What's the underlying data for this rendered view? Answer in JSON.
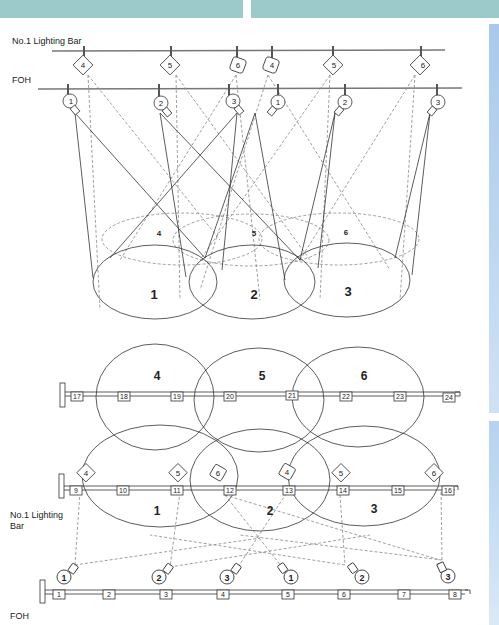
{
  "header": {
    "left_bar_color": "#9ccacb",
    "right_bar_color": "#9ccacb"
  },
  "side_panel": {
    "color": "#b9d5f0"
  },
  "elevation_view": {
    "bar_labels": {
      "lighting_bar": "No.1 Lighting Bar",
      "foh": "FOH"
    },
    "lighting_bar_lanterns": [
      "4",
      "5",
      "6",
      "4",
      "5",
      "6"
    ],
    "foh_lanterns": [
      "1",
      "2",
      "3",
      "1",
      "2",
      "3"
    ],
    "upstage_areas": [
      "4",
      "5",
      "6"
    ],
    "downstage_areas": [
      "1",
      "2",
      "3"
    ]
  },
  "plan_view": {
    "bar_labels": {
      "lighting_bar": "No.1 Lighting\nBar",
      "lighting_bar_line1": "No.1 Lighting",
      "lighting_bar_line2": "Bar",
      "foh": "FOH"
    },
    "upstage_bar_circuits": [
      "17",
      "18",
      "19",
      "20",
      "21",
      "22",
      "23",
      "24"
    ],
    "lighting_bar_circuits": [
      "9",
      "10",
      "11",
      "12",
      "13",
      "14",
      "15",
      "16"
    ],
    "foh_circuits": [
      "1",
      "2",
      "3",
      "4",
      "5",
      "6",
      "7",
      "8"
    ],
    "lighting_bar_lanterns": [
      "4",
      "5",
      "6",
      "4",
      "5",
      "6"
    ],
    "foh_lanterns": [
      "1",
      "2",
      "3",
      "1",
      "2",
      "3"
    ],
    "upstage_areas": [
      "4",
      "5",
      "6"
    ],
    "downstage_areas": [
      "1",
      "2",
      "3"
    ]
  }
}
